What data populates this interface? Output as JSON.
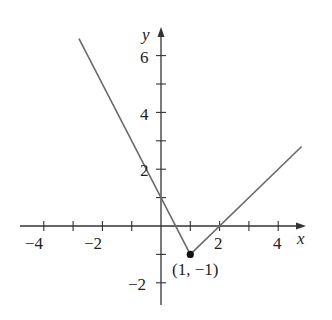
{
  "chart_data": {
    "type": "line",
    "title": "",
    "function": "piecewise: y = -2x + 1 for x <= 1; y = x - 2 for x >= 1",
    "xlabel": "x",
    "ylabel": "y",
    "xlim": [
      -4.9,
      4.9
    ],
    "ylim": [
      -2.8,
      6.9
    ],
    "x_tick_labels": [
      "-4",
      "-2",
      "2",
      "4"
    ],
    "y_tick_labels": [
      "6",
      "4",
      "2",
      "-2"
    ],
    "x_ticks": [
      -4,
      -3,
      -2,
      -1,
      1,
      2,
      3,
      4
    ],
    "y_ticks": [
      -2,
      -1,
      1,
      2,
      3,
      4,
      5,
      6
    ],
    "grid": false,
    "series": [
      {
        "name": "graph",
        "x": [
          -2.8,
          1,
          4.8
        ],
        "y": [
          6.6,
          -1,
          2.8
        ],
        "color": "#6b6b6b"
      }
    ],
    "annotations": [
      {
        "text": "(1, −1)",
        "x": 1,
        "y": -1,
        "marker": "filled-dot"
      }
    ]
  },
  "labels": {
    "x_axis": "x",
    "y_axis": "y",
    "xt_m4": "−4",
    "xt_m2": "−2",
    "xt_2": "2",
    "xt_4": "4",
    "yt_6": "6",
    "yt_4": "4",
    "yt_2": "2",
    "yt_m2": "−2",
    "point": "(1, −1)"
  }
}
